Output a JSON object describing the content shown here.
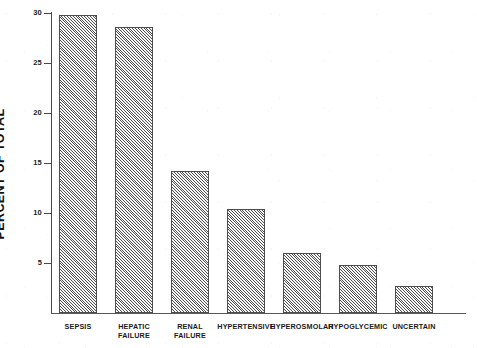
{
  "chart_data": {
    "type": "bar",
    "title": "",
    "xlabel": "",
    "ylabel": "PERCENT OF TOTAL",
    "ylim": [
      0,
      30
    ],
    "yticks": [
      5,
      10,
      15,
      20,
      25,
      30
    ],
    "grid": false,
    "legend": null,
    "categories": [
      "SEPSIS",
      "HEPATIC FAILURE",
      "RENAL FAILURE",
      "HYPERTENSIVE",
      "HYPEROSMOLAR",
      "HYPOGLYCEMIC",
      "UNCERTAIN"
    ],
    "category_lines": [
      [
        "SEPSIS"
      ],
      [
        "HEPATIC",
        "FAILURE"
      ],
      [
        "RENAL",
        "FAILURE"
      ],
      [
        "HYPERTENSIVE"
      ],
      [
        "HYPEROSMOLAR"
      ],
      [
        "HYPOGLYCEMIC"
      ],
      [
        "UNCERTAIN"
      ]
    ],
    "values": [
      29.8,
      28.6,
      14.2,
      10.4,
      6.0,
      4.8,
      2.7
    ],
    "bar_fill": "#b6b6b6",
    "bar_hatch": "diagonal-45",
    "bar_edge_color": "#4d4d4d",
    "axis_color": "#4a4a4a",
    "background": "#ffffff"
  },
  "axis": {
    "y_title": "PERCENT OF TOTAL",
    "tick_labels": [
      "30",
      "25",
      "20",
      "15",
      "10",
      "5"
    ]
  }
}
